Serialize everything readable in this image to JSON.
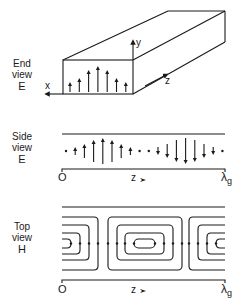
{
  "end_view": {
    "label_line1": "End",
    "label_line2": "view",
    "label_line3": "E",
    "axis_x": "x",
    "axis_y": "y",
    "axis_z": "z",
    "field_arrow_heights": [
      10,
      14,
      22,
      26,
      22,
      14,
      10
    ]
  },
  "side_view": {
    "label_line1": "Side",
    "label_line2": "view",
    "label_line3": "E",
    "origin": "O",
    "axis": "z",
    "end_label": "λ",
    "end_subscript": "g",
    "field_vectors": [
      0,
      8,
      14,
      22,
      26,
      22,
      14,
      8,
      0,
      0,
      -8,
      -14,
      -22,
      -26,
      -22,
      -14,
      -8,
      0
    ]
  },
  "top_view": {
    "label_line1": "Top",
    "label_line2": "view",
    "label_line3": "H",
    "origin": "O",
    "axis": "z",
    "end_label": "λ",
    "end_subscript": "g"
  },
  "colors": {
    "ink": "#1a1a1a",
    "background": "#ffffff"
  }
}
